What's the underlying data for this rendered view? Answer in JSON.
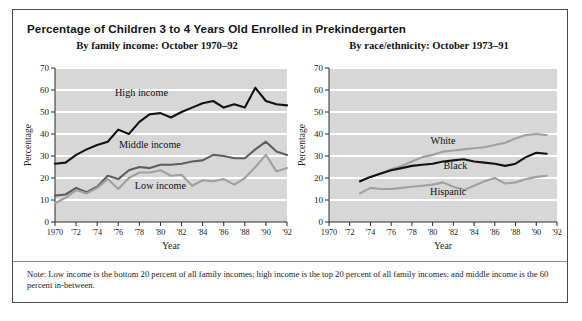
{
  "figure": {
    "title": "Percentage of Children 3 to 4 Years Old Enrolled in Prekindergarten",
    "note": "Note: Low income is the bottom 20 percent of all family incomes; high income is the top 20 percent of all family incomes; and middle income is the 60 percent in-between."
  },
  "colors": {
    "plot_background": "#d7d7d7",
    "gridline": "#ffffff",
    "axis": "#2a2a2a",
    "dark_series": "#121212",
    "mid_series": "#5e5e5e",
    "light_series": "#a0a0a0",
    "frame": "#4a4a4a"
  },
  "chart_data": [
    {
      "type": "line",
      "panel_id": "left",
      "title": "By family income: October 1970–92",
      "xlabel": "Year",
      "ylabel": "Percentage",
      "xlim": [
        1970,
        1992
      ],
      "ylim": [
        0,
        70
      ],
      "yticks": [
        0,
        10,
        20,
        30,
        40,
        50,
        60,
        70
      ],
      "xticks": [
        1970,
        1972,
        1974,
        1976,
        1978,
        1980,
        1982,
        1984,
        1986,
        1988,
        1990,
        1992
      ],
      "xticklabels": [
        "1970",
        "'72",
        "'74",
        "'76",
        "'78",
        "'80",
        "'82",
        "'84",
        "'86",
        "'88",
        "'90",
        "'92"
      ],
      "grid": "horizontal",
      "legend": "inline-annotations",
      "x": [
        1970,
        1971,
        1972,
        1973,
        1974,
        1975,
        1976,
        1977,
        1978,
        1979,
        1980,
        1981,
        1982,
        1983,
        1984,
        1985,
        1986,
        1987,
        1988,
        1989,
        1990,
        1991,
        1992
      ],
      "series": [
        {
          "name": "High income",
          "color": "#121212",
          "label_x": 1978.2,
          "label_y": 57.5,
          "values": [
            26.5,
            27.0,
            30.5,
            33.0,
            35.0,
            36.5,
            42.0,
            40.0,
            45.5,
            49.0,
            49.5,
            47.5,
            50.0,
            52.0,
            54.0,
            55.0,
            52.0,
            53.5,
            52.0,
            61.0,
            55.0,
            53.5,
            53.0
          ]
        },
        {
          "name": "Middle income",
          "color": "#5e5e5e",
          "label_x": 1979.0,
          "label_y": 33.5,
          "values": [
            12.0,
            12.5,
            15.5,
            13.5,
            16.0,
            21.0,
            19.5,
            23.5,
            25.0,
            24.5,
            26.0,
            26.0,
            26.5,
            27.5,
            28.0,
            30.5,
            30.0,
            29.0,
            29.0,
            33.0,
            36.5,
            32.0,
            30.5
          ]
        },
        {
          "name": "Low income",
          "color": "#a0a0a0",
          "label_x": 1980.0,
          "label_y": 15.0,
          "values": [
            8.5,
            11.0,
            14.5,
            13.0,
            15.5,
            19.5,
            15.0,
            20.0,
            22.5,
            22.5,
            23.5,
            21.0,
            21.5,
            16.5,
            19.0,
            18.5,
            19.5,
            17.0,
            20.0,
            25.0,
            30.5,
            23.0,
            24.5
          ]
        }
      ]
    },
    {
      "type": "line",
      "panel_id": "right",
      "title": "By race/ethnicity: October 1973–91",
      "xlabel": "Year",
      "ylabel": "Percentage",
      "xlim": [
        1970,
        1992
      ],
      "ylim": [
        0,
        70
      ],
      "yticks": [
        0,
        10,
        20,
        30,
        40,
        50,
        60,
        70
      ],
      "xticks": [
        1970,
        1972,
        1974,
        1976,
        1978,
        1980,
        1982,
        1984,
        1986,
        1988,
        1990,
        1992
      ],
      "xticklabels": [
        "1970",
        "'72",
        "'74",
        "'76",
        "'78",
        "'80",
        "'82",
        "'84",
        "'86",
        "'88",
        "'90",
        "'92"
      ],
      "grid": "horizontal",
      "legend": "inline-annotations",
      "x": [
        1973,
        1974,
        1975,
        1976,
        1977,
        1978,
        1979,
        1980,
        1981,
        1982,
        1983,
        1984,
        1985,
        1986,
        1987,
        1988,
        1989,
        1990,
        1991
      ],
      "series": [
        {
          "name": "White",
          "color": "#a0a0a0",
          "label_x": 1981.0,
          "label_y": 35.5,
          "values": [
            18.5,
            20.5,
            22.0,
            24.0,
            25.5,
            27.5,
            29.5,
            30.5,
            32.0,
            32.5,
            33.0,
            33.5,
            34.0,
            35.0,
            36.0,
            38.0,
            39.5,
            40.0,
            39.5
          ]
        },
        {
          "name": "Black",
          "color": "#121212",
          "label_x": 1982.2,
          "label_y": 24.0,
          "values": [
            18.5,
            20.5,
            22.0,
            23.5,
            24.5,
            25.5,
            26.0,
            26.5,
            27.5,
            28.0,
            28.5,
            27.5,
            27.0,
            26.5,
            25.5,
            26.5,
            29.5,
            31.5,
            31.0
          ]
        },
        {
          "name": "Hispanic",
          "color": "#a0a0a0",
          "label_x": 1981.5,
          "label_y": 12.5,
          "values": [
            13.0,
            15.5,
            15.0,
            15.0,
            15.5,
            16.0,
            16.5,
            17.0,
            18.0,
            16.0,
            14.5,
            16.5,
            18.5,
            20.0,
            17.5,
            18.0,
            19.5,
            20.5,
            21.0
          ]
        }
      ]
    }
  ]
}
